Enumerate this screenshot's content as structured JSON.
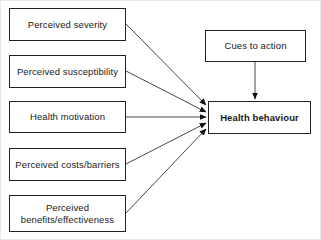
{
  "diagram": {
    "background_color": "#ffffff",
    "line_color": "#222222",
    "text_color": "#1a1a1a",
    "determinants": [
      {
        "id": "perceived-severity",
        "label": "Perceived severity",
        "x": 9,
        "y": 8,
        "w": 117,
        "h": 33
      },
      {
        "id": "perceived-susceptibility",
        "label": "Perceived susceptibility",
        "x": 9,
        "y": 55,
        "w": 117,
        "h": 33
      },
      {
        "id": "health-motivation",
        "label": "Health motivation",
        "x": 9,
        "y": 101,
        "w": 117,
        "h": 32
      },
      {
        "id": "perceived-costs-barriers",
        "label": "Perceived costs/barriers",
        "x": 9,
        "y": 148,
        "w": 117,
        "h": 33
      },
      {
        "id": "perceived-benefits-effectiveness",
        "label": "Perceived\nbenefits/effectiveness",
        "x": 9,
        "y": 195,
        "w": 117,
        "h": 37
      }
    ],
    "cues": {
      "id": "cues-to-action",
      "label": "Cues to action",
      "x": 205,
      "y": 30,
      "w": 101,
      "h": 32
    },
    "outcome": {
      "id": "health-behaviour",
      "label": "Health behaviour",
      "x": 208,
      "y": 101,
      "w": 103,
      "h": 33
    },
    "arrows": [
      {
        "name": "arrow-severity-to-behaviour",
        "x1": 126,
        "y1": 24,
        "x2": 206,
        "y2": 105
      },
      {
        "name": "arrow-susceptibility-to-behaviour",
        "x1": 126,
        "y1": 71,
        "x2": 206,
        "y2": 112
      },
      {
        "name": "arrow-motivation-to-behaviour",
        "x1": 126,
        "y1": 117,
        "x2": 206,
        "y2": 117
      },
      {
        "name": "arrow-costs-to-behaviour",
        "x1": 126,
        "y1": 164,
        "x2": 206,
        "y2": 123
      },
      {
        "name": "arrow-benefits-to-behaviour",
        "x1": 126,
        "y1": 213,
        "x2": 206,
        "y2": 129
      },
      {
        "name": "arrow-cues-to-behaviour",
        "x1": 255,
        "y1": 62,
        "x2": 255,
        "y2": 99
      }
    ]
  }
}
